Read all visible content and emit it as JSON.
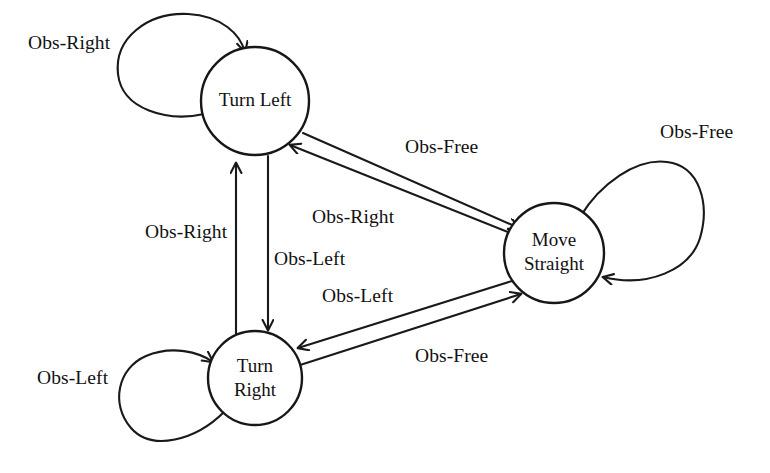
{
  "diagram": {
    "background_color": "#ffffff",
    "stroke_color": "#191919",
    "text_color": "#111111",
    "nodes": [
      {
        "id": "turn-left",
        "label": "Turn Left",
        "label_lines": [
          "Turn Left"
        ],
        "cx": 255,
        "cy": 101,
        "r": 54
      },
      {
        "id": "move-straight",
        "label": "Move Straight",
        "label_lines": [
          "Move",
          "Straight"
        ],
        "cx": 554,
        "cy": 253,
        "r": 50
      },
      {
        "id": "turn-right",
        "label": "Turn Right",
        "label_lines": [
          "Turn",
          "Right"
        ],
        "cx": 255,
        "cy": 378,
        "r": 47
      }
    ],
    "edges": [
      {
        "id": "turn-left-self",
        "from": "turn-left",
        "to": "turn-left",
        "label": "Obs-Right",
        "kind": "self-loop"
      },
      {
        "id": "move-straight-self",
        "from": "move-straight",
        "to": "move-straight",
        "label": "Obs-Free",
        "kind": "self-loop"
      },
      {
        "id": "turn-right-self",
        "from": "turn-right",
        "to": "turn-right",
        "label": "Obs-Left",
        "kind": "self-loop"
      },
      {
        "id": "turn-left-to-move-straight",
        "from": "turn-left",
        "to": "move-straight",
        "label": "Obs-Free",
        "kind": "straight"
      },
      {
        "id": "move-straight-to-turn-left",
        "from": "move-straight",
        "to": "turn-left",
        "label": "Obs-Right",
        "kind": "straight"
      },
      {
        "id": "turn-right-to-turn-left",
        "from": "turn-right",
        "to": "turn-left",
        "label": "Obs-Right",
        "kind": "straight"
      },
      {
        "id": "turn-left-to-turn-right",
        "from": "turn-left",
        "to": "turn-right",
        "label": "Obs-Left",
        "kind": "straight"
      },
      {
        "id": "move-straight-to-turn-right",
        "from": "move-straight",
        "to": "turn-right",
        "label": "Obs-Left",
        "kind": "straight"
      },
      {
        "id": "turn-right-to-move-straight",
        "from": "turn-right",
        "to": "move-straight",
        "label": "Obs-Free",
        "kind": "straight"
      }
    ],
    "labels": {
      "self_left_obs_right": "Obs-Right",
      "self_right_obs_free": "Obs-Free",
      "self_bottom_obs_left": "Obs-Left",
      "top_diag_obs_free": "Obs-Free",
      "mid_diag_obs_right": "Obs-Right",
      "vertical_obs_right": "Obs-Right",
      "vertical_obs_left": "Obs-Left",
      "lower_diag_obs_left": "Obs-Left",
      "bottom_diag_obs_free": "Obs-Free"
    },
    "node_text": {
      "turn_left": "Turn Left",
      "move_line1": "Move",
      "move_line2": "Straight",
      "right_line1": "Turn",
      "right_line2": "Right"
    }
  }
}
